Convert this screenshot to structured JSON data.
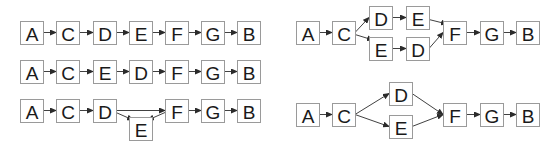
{
  "colors": {
    "node_border": "#9a9a9a",
    "edge": "#2b2b2b",
    "text": "#1a1a1a",
    "background": "#ffffff"
  },
  "diagrams": [
    {
      "id": "left-row-1",
      "nodes": [
        {
          "id": "a",
          "label": "A",
          "x": 20,
          "y": 21
        },
        {
          "id": "c",
          "label": "C",
          "x": 56,
          "y": 21
        },
        {
          "id": "d",
          "label": "D",
          "x": 93,
          "y": 21
        },
        {
          "id": "e",
          "label": "E",
          "x": 129,
          "y": 21
        },
        {
          "id": "f",
          "label": "F",
          "x": 165,
          "y": 21
        },
        {
          "id": "g",
          "label": "G",
          "x": 201,
          "y": 21
        },
        {
          "id": "b",
          "label": "B",
          "x": 237,
          "y": 21
        }
      ],
      "edges": [
        [
          "a",
          "c"
        ],
        [
          "c",
          "d"
        ],
        [
          "d",
          "e"
        ],
        [
          "e",
          "f"
        ],
        [
          "f",
          "g"
        ],
        [
          "g",
          "b"
        ]
      ]
    },
    {
      "id": "left-row-2",
      "nodes": [
        {
          "id": "a",
          "label": "A",
          "x": 20,
          "y": 60
        },
        {
          "id": "c",
          "label": "C",
          "x": 56,
          "y": 60
        },
        {
          "id": "e",
          "label": "E",
          "x": 93,
          "y": 60
        },
        {
          "id": "d",
          "label": "D",
          "x": 129,
          "y": 60
        },
        {
          "id": "f",
          "label": "F",
          "x": 165,
          "y": 60
        },
        {
          "id": "g",
          "label": "G",
          "x": 201,
          "y": 60
        },
        {
          "id": "b",
          "label": "B",
          "x": 237,
          "y": 60
        }
      ],
      "edges": [
        [
          "a",
          "c"
        ],
        [
          "c",
          "e"
        ],
        [
          "e",
          "d"
        ],
        [
          "d",
          "f"
        ],
        [
          "f",
          "g"
        ],
        [
          "g",
          "b"
        ]
      ]
    },
    {
      "id": "left-row-3",
      "nodes": [
        {
          "id": "a",
          "label": "A",
          "x": 20,
          "y": 99
        },
        {
          "id": "c",
          "label": "C",
          "x": 56,
          "y": 99
        },
        {
          "id": "d",
          "label": "D",
          "x": 93,
          "y": 99
        },
        {
          "id": "e",
          "label": "E",
          "x": 129,
          "y": 117
        },
        {
          "id": "f",
          "label": "F",
          "x": 165,
          "y": 99
        },
        {
          "id": "g",
          "label": "G",
          "x": 201,
          "y": 99
        },
        {
          "id": "b",
          "label": "B",
          "x": 237,
          "y": 99
        }
      ],
      "edges": [
        [
          "a",
          "c"
        ],
        [
          "c",
          "d"
        ],
        [
          "d",
          "f"
        ],
        [
          "d",
          "e"
        ],
        [
          "f",
          "e"
        ],
        [
          "f",
          "g"
        ],
        [
          "g",
          "b"
        ]
      ]
    },
    {
      "id": "right-top",
      "nodes": [
        {
          "id": "a",
          "label": "A",
          "x": 296,
          "y": 21
        },
        {
          "id": "c",
          "label": "C",
          "x": 332,
          "y": 21
        },
        {
          "id": "d1",
          "label": "D",
          "x": 369,
          "y": 6
        },
        {
          "id": "e1",
          "label": "E",
          "x": 406,
          "y": 6
        },
        {
          "id": "e2",
          "label": "E",
          "x": 369,
          "y": 37
        },
        {
          "id": "d2",
          "label": "D",
          "x": 406,
          "y": 37
        },
        {
          "id": "f",
          "label": "F",
          "x": 443,
          "y": 21
        },
        {
          "id": "g",
          "label": "G",
          "x": 480,
          "y": 21
        },
        {
          "id": "b",
          "label": "B",
          "x": 516,
          "y": 21
        }
      ],
      "edges": [
        [
          "a",
          "c"
        ],
        [
          "c",
          "d1"
        ],
        [
          "c",
          "e2"
        ],
        [
          "d1",
          "e1"
        ],
        [
          "e2",
          "d2"
        ],
        [
          "e1",
          "f"
        ],
        [
          "d2",
          "f"
        ],
        [
          "f",
          "g"
        ],
        [
          "g",
          "b"
        ]
      ]
    },
    {
      "id": "right-bottom",
      "nodes": [
        {
          "id": "a",
          "label": "A",
          "x": 296,
          "y": 103
        },
        {
          "id": "c",
          "label": "C",
          "x": 332,
          "y": 103
        },
        {
          "id": "d",
          "label": "D",
          "x": 389,
          "y": 82
        },
        {
          "id": "e",
          "label": "E",
          "x": 389,
          "y": 115
        },
        {
          "id": "f",
          "label": "F",
          "x": 443,
          "y": 103
        },
        {
          "id": "g",
          "label": "G",
          "x": 480,
          "y": 103
        },
        {
          "id": "b",
          "label": "B",
          "x": 516,
          "y": 103
        }
      ],
      "edges": [
        [
          "a",
          "c"
        ],
        [
          "c",
          "d"
        ],
        [
          "c",
          "e"
        ],
        [
          "d",
          "f"
        ],
        [
          "e",
          "f"
        ],
        [
          "f",
          "g"
        ],
        [
          "g",
          "b"
        ]
      ]
    }
  ]
}
